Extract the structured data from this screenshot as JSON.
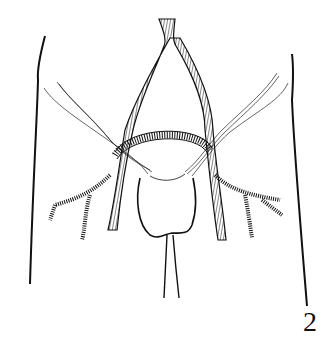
{
  "figure": {
    "number_label": "2",
    "colors": {
      "line": "#111111",
      "background": "#ffffff"
    }
  },
  "elements": {
    "body_outline": "Left and right body contour lines",
    "aorta": "Hatched aorta bifurcating into left and right iliac arteries",
    "graft_loop": "Hatched crossover graft arching between the iliac arteries",
    "ligaments": "Fine strands running diagonally from flanks across vessels",
    "bladder": "Rounded bladder shape with urethra tube below",
    "branches": "Hatched iliac branches on both sides"
  }
}
